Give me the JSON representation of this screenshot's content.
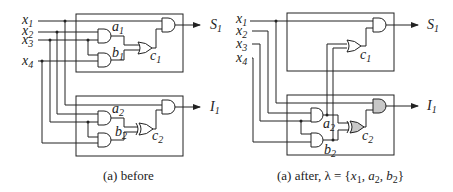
{
  "diagram": {
    "type": "logic-circuit-comparison",
    "colors": {
      "line": "#222222",
      "highlight_gate": "#c8c8c8",
      "background": "#ffffff"
    },
    "panels": [
      {
        "id": "before",
        "caption": "(a) before",
        "inputs": [
          {
            "name": "x",
            "sub": "1"
          },
          {
            "name": "x",
            "sub": "2"
          },
          {
            "name": "x",
            "sub": "3"
          },
          {
            "name": "x",
            "sub": "4"
          }
        ],
        "outputs": [
          {
            "name": "S",
            "sub": "1"
          },
          {
            "name": "I",
            "sub": "1"
          }
        ],
        "gate_labels": {
          "a1": {
            "name": "a",
            "sub": "1"
          },
          "b1": {
            "name": "b",
            "sub": "1"
          },
          "c1": {
            "name": "c",
            "sub": "1"
          },
          "a2": {
            "name": "a",
            "sub": "2"
          },
          "b2": {
            "name": "b",
            "sub": "2"
          },
          "c2": {
            "name": "c",
            "sub": "2"
          }
        }
      },
      {
        "id": "after",
        "caption_prefix": "(a) after, ",
        "caption_lambda": "λ = {",
        "caption_x": "x",
        "caption_x_sub": "1",
        "caption_sep1": ", ",
        "caption_a": "a",
        "caption_a_sub": "2",
        "caption_sep2": ", ",
        "caption_b": "b",
        "caption_b_sub": "2",
        "caption_close": "}",
        "inputs": [
          {
            "name": "x",
            "sub": "1"
          },
          {
            "name": "x",
            "sub": "2"
          },
          {
            "name": "x",
            "sub": "3"
          },
          {
            "name": "x",
            "sub": "4"
          }
        ],
        "outputs": [
          {
            "name": "S",
            "sub": "1"
          },
          {
            "name": "I",
            "sub": "1"
          }
        ],
        "gate_labels": {
          "c1": {
            "name": "c",
            "sub": "1"
          },
          "a2": {
            "name": "a",
            "sub": "2"
          },
          "b2": {
            "name": "b",
            "sub": "2"
          },
          "c2": {
            "name": "c",
            "sub": "2"
          }
        }
      }
    ]
  }
}
